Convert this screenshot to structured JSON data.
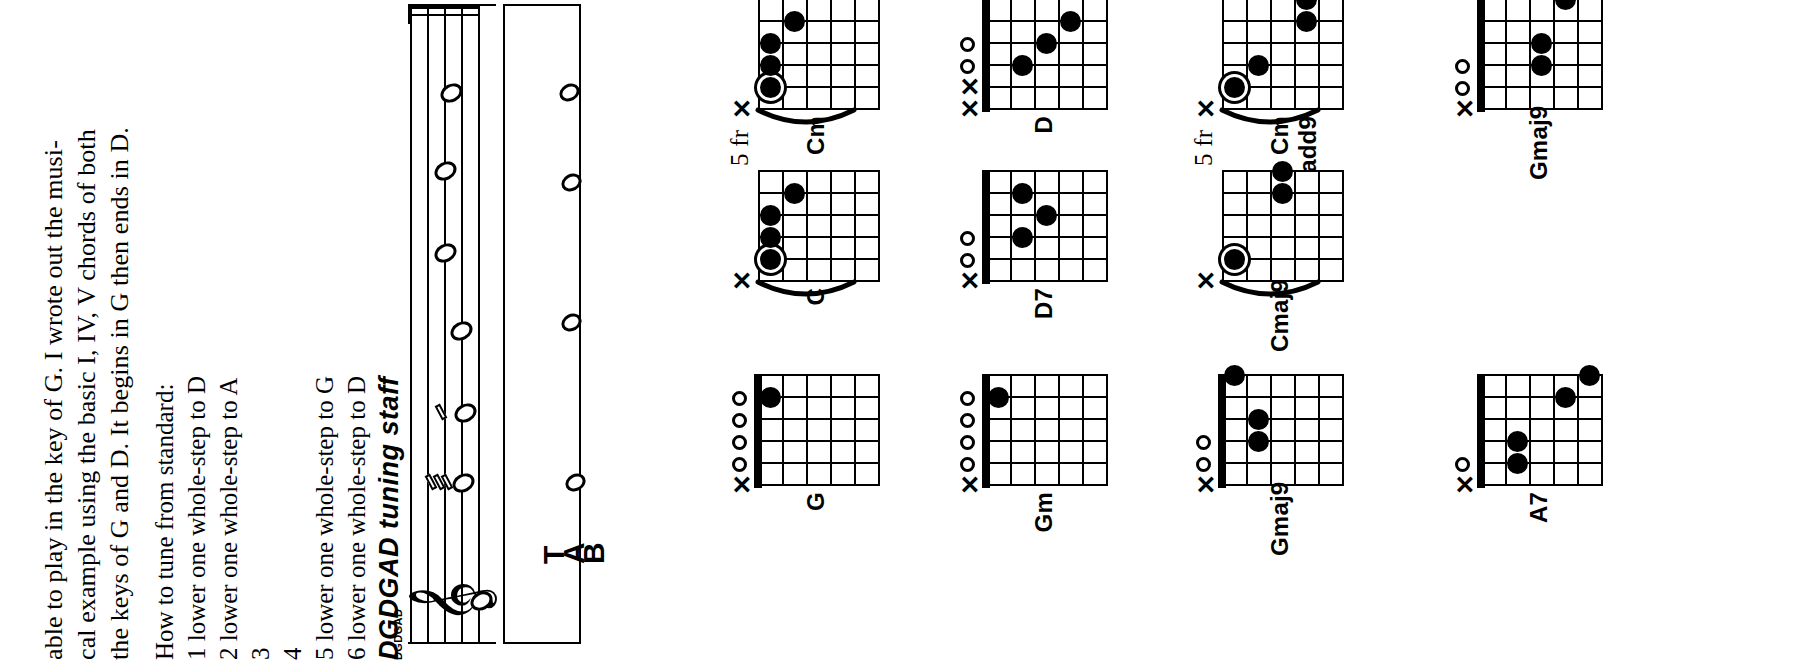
{
  "page": {
    "orientation": "rotated-90-ccw",
    "background": "#ffffff",
    "ink": "#000000"
  },
  "paragraph": {
    "lines": [
      "able to play in the key of G. I wrote out the musi-",
      "cal example using the basic I, IV, V chords of both",
      "the keys of G and D. It begins in G then ends in D."
    ]
  },
  "tuning": {
    "heading": "How to tune from standard:",
    "steps": [
      "1 lower one whole-step to D",
      "2 lower one whole-step to A",
      "3",
      "4",
      "5 lower one whole-step to G",
      "6 lower one whole-step to D"
    ]
  },
  "notation": {
    "title": "DGDGAD tuning staff",
    "subtitle": "DGDGAD",
    "clef_glyph": "𝄞",
    "tab_letters": [
      "T",
      "A",
      "B"
    ],
    "staff_notes": [
      "D",
      "G",
      "D",
      "G",
      "A",
      "D"
    ]
  },
  "chords": {
    "columns": [
      {
        "items": [
          {
            "name": "G",
            "fret_label": "",
            "nut": true,
            "markers": [
              "X",
              "O",
              "O",
              "O",
              "O"
            ],
            "dots": [
              {
                "string": 5,
                "fret": 1
              }
            ],
            "barre": false,
            "root_ring": false
          },
          {
            "name": "Gm",
            "fret_label": "",
            "nut": true,
            "markers": [
              "X",
              "O",
              "O",
              "O",
              "O"
            ],
            "dots": [
              {
                "string": 5,
                "fret": 1
              }
            ],
            "barre": false,
            "root_ring": false
          },
          {
            "name": "Gmaj9",
            "fret_label": "",
            "nut": true,
            "markers": [
              "X",
              "O",
              "O"
            ],
            "dots": [
              {
                "string": 3,
                "fret": 2
              },
              {
                "string": 4,
                "fret": 2
              },
              {
                "string": 6,
                "fret": 1
              }
            ],
            "barre": false,
            "root_ring": false
          },
          {
            "name": "A7",
            "fret_label": "",
            "nut": true,
            "markers": [
              "X",
              "O"
            ],
            "dots": [
              {
                "string": 2,
                "fret": 2
              },
              {
                "string": 3,
                "fret": 2
              },
              {
                "string": 5,
                "fret": 4
              },
              {
                "string": 6,
                "fret": 5
              }
            ],
            "barre": false,
            "root_ring": false
          }
        ]
      },
      {
        "items": [
          {
            "name": "C",
            "fret_label": "5 fr",
            "nut": false,
            "markers": [
              "X"
            ],
            "dots": [
              {
                "string": 2,
                "fret": 1
              },
              {
                "string": 3,
                "fret": 1
              },
              {
                "string": 4,
                "fret": 1
              },
              {
                "string": 5,
                "fret": 2
              }
            ],
            "barre": true,
            "root_ring": true
          },
          {
            "name": "D7",
            "fret_label": "",
            "nut": true,
            "markers": [
              "X",
              "O",
              "O"
            ],
            "dots": [
              {
                "string": 3,
                "fret": 2
              },
              {
                "string": 4,
                "fret": 3
              },
              {
                "string": 5,
                "fret": 2
              }
            ],
            "barre": false,
            "root_ring": false
          },
          {
            "name": "Cmaj9",
            "fret_label": "5 fr",
            "nut": false,
            "markers": [
              "X"
            ],
            "dots": [
              {
                "string": 2,
                "fret": 1
              },
              {
                "string": 5,
                "fret": 3
              },
              {
                "string": 6,
                "fret": 3
              }
            ],
            "barre": true,
            "root_ring": true
          }
        ]
      },
      {
        "items": [
          {
            "name": "Cm",
            "fret_label": "5 fr",
            "nut": false,
            "markers": [
              "X"
            ],
            "dots": [
              {
                "string": 2,
                "fret": 1
              },
              {
                "string": 3,
                "fret": 1
              },
              {
                "string": 4,
                "fret": 1
              },
              {
                "string": 5,
                "fret": 2
              }
            ],
            "barre": true,
            "root_ring": true
          },
          {
            "name": "D",
            "fret_label": "",
            "nut": true,
            "markers": [
              "X",
              "X",
              "O",
              "O"
            ],
            "dots": [
              {
                "string": 3,
                "fret": 2
              },
              {
                "string": 4,
                "fret": 3
              },
              {
                "string": 5,
                "fret": 4
              }
            ],
            "barre": false,
            "root_ring": false
          },
          {
            "name": "Cm add9",
            "fret_label": "5 fr",
            "nut": false,
            "markers": [
              "X"
            ],
            "dots": [
              {
                "string": 2,
                "fret": 1
              },
              {
                "string": 3,
                "fret": 2
              },
              {
                "string": 5,
                "fret": 4
              },
              {
                "string": 6,
                "fret": 4
              }
            ],
            "barre": true,
            "root_ring": true
          },
          {
            "name": "Gmaj9",
            "fret_label": "",
            "nut": true,
            "markers": [
              "X",
              "O",
              "O"
            ],
            "dots": [
              {
                "string": 3,
                "fret": 3
              },
              {
                "string": 4,
                "fret": 3
              },
              {
                "string": 6,
                "fret": 4
              }
            ],
            "barre": false,
            "root_ring": false
          }
        ]
      }
    ]
  }
}
